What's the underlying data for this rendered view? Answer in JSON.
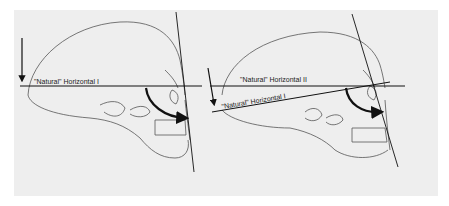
{
  "figure": {
    "background": "#eeeeee",
    "left_panel": {
      "label_1": "\"Natural\" Horizontal I"
    },
    "right_panel": {
      "label_2": "\"Natural\" Horizontal II",
      "label_1": "\"Natural\" Horizontal I"
    }
  }
}
